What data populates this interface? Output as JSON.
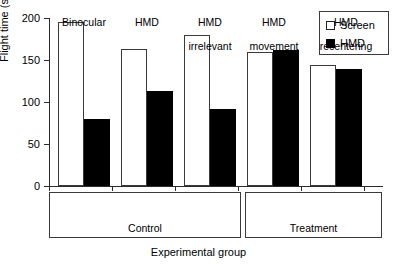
{
  "chart_data": {
    "type": "bar",
    "title": "",
    "xlabel": "Experimental group",
    "ylabel": "Flight time (s)",
    "ylim": [
      0,
      200
    ],
    "yticks": [
      0,
      50,
      100,
      150,
      200
    ],
    "grid": false,
    "legend_position": "top-right",
    "categories": [
      "Binocular",
      "HMD",
      "HMD irrelevant",
      "HMD movement",
      "HMD recentering"
    ],
    "category_lines": [
      [
        "Binocular"
      ],
      [
        "HMD"
      ],
      [
        "HMD",
        "irrelevant"
      ],
      [
        "HMD",
        "movement"
      ],
      [
        "HMD",
        "recentering"
      ]
    ],
    "series": [
      {
        "name": "Screen",
        "color": "#ffffff",
        "values": [
          195,
          163,
          180,
          160,
          144
        ]
      },
      {
        "name": "HMD",
        "color": "#000000",
        "values": [
          80,
          113,
          92,
          162,
          139
        ]
      }
    ],
    "groups": [
      {
        "name": "Control",
        "categories": [
          "Binocular",
          "HMD",
          "HMD irrelevant"
        ]
      },
      {
        "name": "Treatment",
        "categories": [
          "HMD movement",
          "HMD recentering"
        ]
      }
    ]
  },
  "legend": {
    "items": [
      {
        "label": "Screen",
        "marker": "open-square"
      },
      {
        "label": "HMD",
        "marker": "filled-square"
      }
    ]
  },
  "axis": {
    "y_label": "Flight time (s)",
    "x_label": "Experimental group",
    "y_ticks": [
      "0",
      "50",
      "100",
      "150",
      "200"
    ]
  },
  "groups": {
    "control_label": "Control",
    "treatment_label": "Treatment"
  },
  "categories": {
    "c0_l1": "Binocular",
    "c0_l2": "",
    "c1_l1": "HMD",
    "c1_l2": "",
    "c2_l1": "HMD",
    "c2_l2": "irrelevant",
    "c3_l1": "HMD",
    "c3_l2": "movement",
    "c4_l1": "HMD",
    "c4_l2": "recentering"
  }
}
